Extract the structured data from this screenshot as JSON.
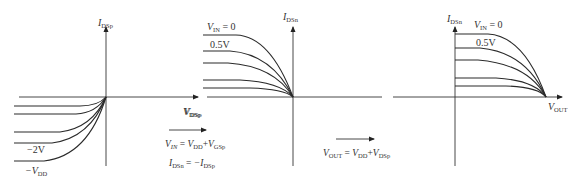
{
  "panels": [
    {
      "id": "pmos",
      "y_axis_label": {
        "main": "I",
        "sub": "DSp"
      },
      "x_axis_label": {
        "main": "V",
        "sub": "DSp"
      },
      "curve_labels": [
        {
          "text": "−2V"
        },
        {
          "main": "−V",
          "sub": "DD"
        }
      ]
    },
    {
      "id": "pmos-transformed",
      "y_axis_label": {
        "main": "I",
        "sub": "DSn"
      },
      "x_axis_label": {
        "main": "V",
        "sub": "DSp"
      },
      "curve_labels": [
        {
          "main": "V",
          "sub": "IN",
          "suffix": " = 0"
        },
        {
          "text": "0.5V"
        }
      ]
    },
    {
      "id": "shifted",
      "y_axis_label": {
        "main": "I",
        "sub": "DSn"
      },
      "x_axis_label": {
        "main": "V",
        "sub": "OUT"
      },
      "curve_labels": [
        {
          "main": "V",
          "sub": "IN",
          "suffix": " = 0"
        },
        {
          "text": "0.5V"
        }
      ]
    }
  ],
  "transforms": [
    {
      "eq1": {
        "lhs": "V",
        "lhs_sub": "IN",
        "rhs1": "V",
        "rhs1_sub": "DD",
        "op": "+",
        "rhs2": "V",
        "rhs2_sub": "GSp"
      },
      "eq2": {
        "lhs": "I",
        "lhs_sub": "DSn",
        "rhs": "−I",
        "rhs_sub": "DSp"
      }
    },
    {
      "eq1": {
        "lhs": "V",
        "lhs_sub": "OUT",
        "rhs1": "V",
        "rhs1_sub": "DD",
        "op": "+",
        "rhs2": "V",
        "rhs2_sub": "DSp"
      }
    }
  ],
  "symbols": {
    "equals": " = ",
    "zero": " = 0"
  }
}
